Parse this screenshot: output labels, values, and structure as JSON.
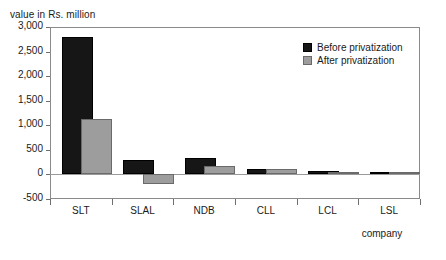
{
  "chart_data": {
    "type": "bar",
    "title": "",
    "ylabel": "value in Rs. million",
    "xlabel": "company",
    "categories": [
      "SLT",
      "SLAL",
      "NDB",
      "CLL",
      "LCL",
      "LSL"
    ],
    "series": [
      {
        "name": "Before privatization",
        "color": "#161616",
        "values": [
          2800,
          290,
          330,
          120,
          60,
          15
        ]
      },
      {
        "name": "After privatization",
        "color": "#9d9d9d",
        "values": [
          1120,
          -200,
          170,
          120,
          10,
          5
        ]
      }
    ],
    "ylim": [
      -500,
      3000
    ],
    "ytick_step": 500,
    "ytick_labels": [
      "3,000",
      "2,500",
      "2,000",
      "1,500",
      "1,000",
      "500",
      "0",
      "-500"
    ],
    "ytick_values": [
      3000,
      2500,
      2000,
      1500,
      1000,
      500,
      0,
      -500
    ],
    "grid": false,
    "legend_position": "top-right"
  }
}
